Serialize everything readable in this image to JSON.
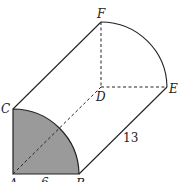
{
  "figure": {
    "type": "quarter-cylinder",
    "labels": {
      "A": "A",
      "B": "B",
      "C": "C",
      "D": "D",
      "E": "E",
      "F": "F",
      "length": "13",
      "radius": "6"
    },
    "colors": {
      "shaded_face": "#9a9a9a",
      "stroke": "#222222"
    }
  }
}
